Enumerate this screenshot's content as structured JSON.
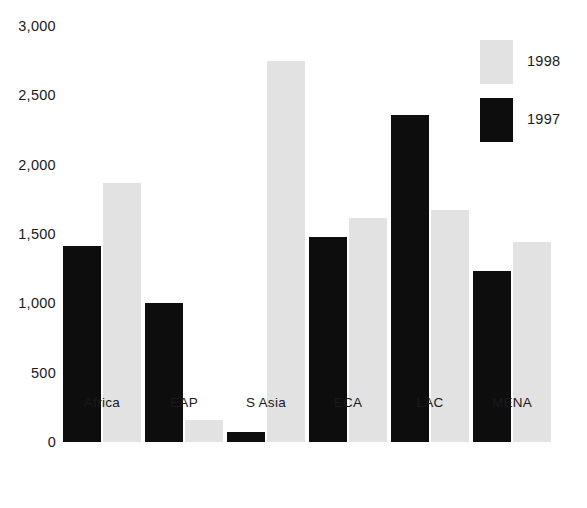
{
  "chart_data": {
    "type": "bar",
    "title": "",
    "subtitle": "",
    "xlabel": "",
    "ylabel": "",
    "categories": [
      "Africa",
      "EAP",
      "S Asia",
      "ECA",
      "LAC",
      "MENA"
    ],
    "series": [
      {
        "name": "1997",
        "color": "#0d0d0d",
        "values": [
          1410,
          1000,
          70,
          1475,
          2360,
          1230
        ]
      },
      {
        "name": "1998",
        "color": "#e2e2e2",
        "values": [
          1870,
          160,
          2745,
          1615,
          1675,
          1440
        ]
      }
    ],
    "ylim": [
      0,
      3000
    ],
    "yticks": [
      0,
      500,
      1000,
      1500,
      2000,
      2500,
      3000
    ],
    "ytick_labels": [
      "0",
      "500",
      "1,000",
      "1,500",
      "2,000",
      "2,500",
      "3,000"
    ],
    "grid": false,
    "legend": {
      "position": "top-right",
      "entries": [
        {
          "label": "1998",
          "color": "#e2e2e2"
        },
        {
          "label": "1997",
          "color": "#0d0d0d"
        }
      ]
    },
    "annotations": [],
    "background_color": "#ffffff"
  }
}
